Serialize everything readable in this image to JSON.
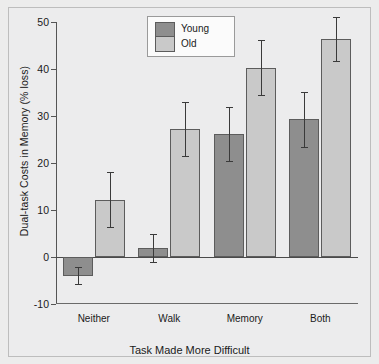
{
  "chart_data": {
    "type": "bar",
    "title": "",
    "xlabel": "Task Made More Difficult",
    "ylabel": "Dual-task Costs in Memory (% loss)",
    "categories": [
      "Neither",
      "Walk",
      "Memory",
      "Both"
    ],
    "ylim": [
      -10,
      50
    ],
    "yticks": [
      -10,
      0,
      10,
      20,
      30,
      40,
      50
    ],
    "ytick_labels": [
      "-10",
      "0",
      "10",
      "20",
      "30",
      "40",
      "50"
    ],
    "grid": false,
    "legend_position": "top-center",
    "series": [
      {
        "name": "Young",
        "color": "#8e8e8e",
        "values": [
          -4.0,
          2.0,
          26.2,
          29.3
        ],
        "errors": [
          1.8,
          3.0,
          5.8,
          5.9
        ]
      },
      {
        "name": "Old",
        "color": "#c9c9c9",
        "values": [
          12.2,
          27.2,
          40.3,
          46.3
        ],
        "errors": [
          5.8,
          5.8,
          5.8,
          4.7
        ]
      }
    ]
  },
  "legend": {
    "young_label": "Young",
    "old_label": "Old"
  },
  "colors": {
    "young": "#8e8e8e",
    "old": "#c9c9c9",
    "axis": "#555555",
    "background": "#ececec"
  }
}
